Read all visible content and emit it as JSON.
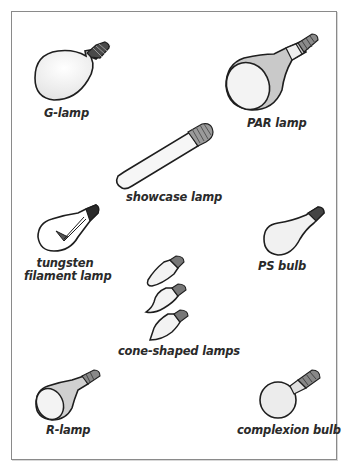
{
  "figure": {
    "items": [
      {
        "id": "g-lamp",
        "label": "G-lamp"
      },
      {
        "id": "par-lamp",
        "label": "PAR lamp"
      },
      {
        "id": "showcase-lamp",
        "label": "showcase lamp"
      },
      {
        "id": "tungsten-filament-lamp",
        "label_line1": "tungsten",
        "label_line2": "filament lamp"
      },
      {
        "id": "ps-bulb",
        "label": "PS bulb"
      },
      {
        "id": "cone-shaped-lamps",
        "label": "cone-shaped lamps"
      },
      {
        "id": "r-lamp",
        "label": "R-lamp"
      },
      {
        "id": "complexion-bulb",
        "label": "complexion bulb"
      }
    ]
  },
  "colors": {
    "outline": "#1e1e1e",
    "glass": "#f3f3f3",
    "shade": "#c9c9c9",
    "base": "#7a7a7a",
    "frame": "#8a8a8a"
  }
}
